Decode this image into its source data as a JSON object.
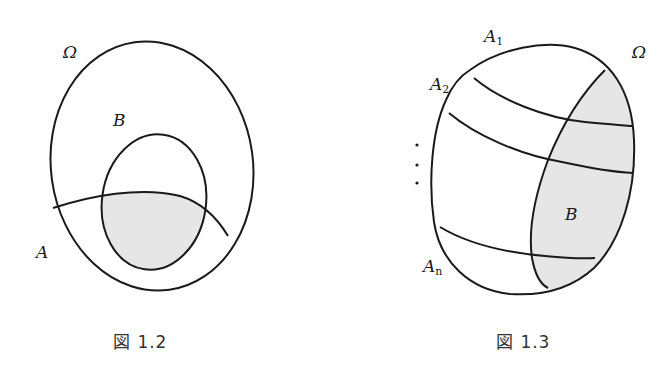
{
  "figures": [
    {
      "id": "fig-1-2",
      "caption": "図 1.2",
      "labels": {
        "omega": "Ω",
        "b": "B",
        "a": "A"
      },
      "description": "Sample space Ω containing event B (ellipse) and event A (region below an arc); the intersection A∩B is shaded."
    },
    {
      "id": "fig-1-3",
      "caption": "図 1.3",
      "labels": {
        "omega": "Ω",
        "b": "B",
        "a1_base": "A",
        "a1_sub": "1",
        "a2_base": "A",
        "a2_sub": "2",
        "an_base": "A",
        "an_sub": "n",
        "dots": "⋮"
      },
      "description": "Sample space Ω partitioned into bands A1, A2, ..., An; event B (right region) is shaded and cuts across every band."
    }
  ],
  "colors": {
    "stroke": "#1a1a1a",
    "shade": "#e6e6e6",
    "background": "#ffffff"
  }
}
